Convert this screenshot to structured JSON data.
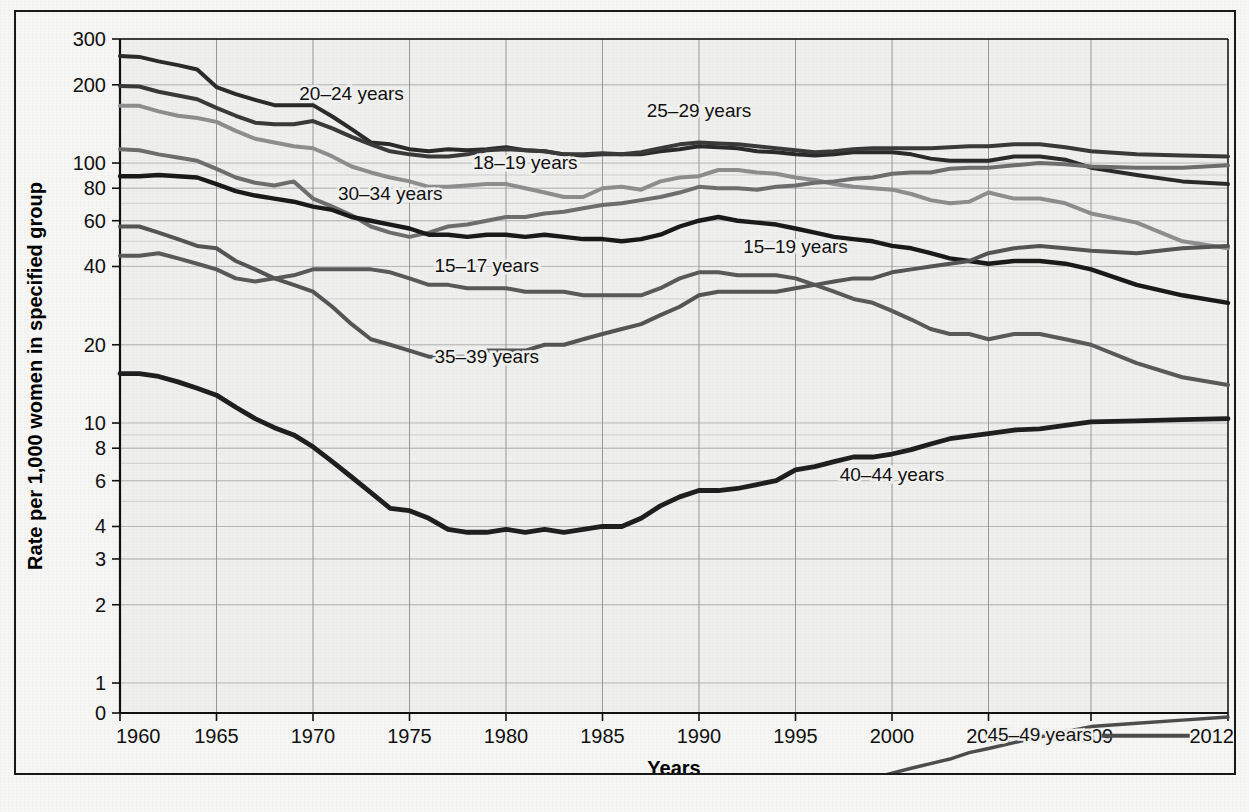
{
  "figure": {
    "background_color": "#f6f6f4",
    "border_color": "#1a1a1a",
    "plot_background_color": "#efefed"
  },
  "axes": {
    "y_label": "Rate per 1,000 women in specified group",
    "x_label": "Years",
    "y_ticks": [
      "300",
      "200",
      "100",
      "80",
      "60",
      "40",
      "20",
      "10",
      "8",
      "6",
      "4",
      "3",
      "2",
      "1",
      "0"
    ],
    "x_ticks": [
      "1960",
      "1965",
      "1970",
      "1975",
      "1980",
      "1985",
      "1990",
      "1995",
      "2000",
      "2005",
      "2009",
      "2012"
    ],
    "y_scale": "log",
    "grid": "on"
  },
  "labels": {
    "s20_24": "20–24 years",
    "s25_29": "25–29 years",
    "s18_19": "18–19 years",
    "s30_34": "30–34 years",
    "s15_19": "15–19 years",
    "s15_17": "15–17 years",
    "s35_39": "35–39 years",
    "s40_44": "40–44 years",
    "s45_49": "45–49 years"
  },
  "chart_data": {
    "type": "line",
    "title": "",
    "subtitle": "",
    "xlabel": "Years",
    "ylabel": "Rate per 1,000 women in specified group",
    "yscale": "log",
    "ylim": [
      1,
      300
    ],
    "yticks": [
      300,
      200,
      100,
      80,
      60,
      40,
      20,
      10,
      8,
      6,
      4,
      3,
      2,
      1,
      0
    ],
    "xticks": [
      1960,
      1965,
      1970,
      1975,
      1980,
      1985,
      1990,
      1995,
      2000,
      2005,
      2009,
      2012
    ],
    "xlim": [
      1960,
      2012
    ],
    "grid": true,
    "legend": "inline-annotations",
    "x": [
      1960,
      1961,
      1962,
      1963,
      1964,
      1965,
      1966,
      1967,
      1968,
      1969,
      1970,
      1971,
      1972,
      1973,
      1974,
      1975,
      1976,
      1977,
      1978,
      1979,
      1980,
      1981,
      1982,
      1983,
      1984,
      1985,
      1986,
      1987,
      1988,
      1989,
      1990,
      1991,
      1992,
      1993,
      1994,
      1995,
      1996,
      1997,
      1998,
      1999,
      2000,
      2001,
      2002,
      2003,
      2004,
      2005,
      2006,
      2007,
      2008,
      2009,
      2010,
      2011,
      2012
    ],
    "series": [
      {
        "name": "20–24 years",
        "color": "#2b2b2b",
        "width": 4.0,
        "values": [
          258,
          256,
          246,
          238,
          229,
          196,
          184,
          175,
          167,
          167,
          167,
          151,
          135,
          120,
          118,
          113,
          111,
          113,
          112,
          113,
          115,
          112,
          111,
          108,
          107,
          108,
          108,
          108,
          111,
          113,
          116,
          115,
          114,
          111,
          110,
          108,
          107,
          108,
          110,
          110,
          110,
          108,
          104,
          102,
          102,
          102,
          106,
          106,
          103,
          96,
          90,
          85,
          83
        ]
      },
      {
        "name": "25–29 years",
        "color": "#3a3a3a",
        "width": 4.0,
        "values": [
          198,
          197,
          188,
          182,
          176,
          163,
          152,
          143,
          141,
          141,
          145,
          136,
          126,
          118,
          111,
          108,
          106,
          106,
          108,
          112,
          113,
          112,
          111,
          108,
          108,
          109,
          108,
          110,
          114,
          118,
          120,
          119,
          118,
          116,
          114,
          112,
          110,
          111,
          113,
          114,
          114,
          114,
          114,
          115,
          116,
          116,
          118,
          118,
          115,
          111,
          108,
          107,
          106
        ]
      },
      {
        "name": "18–19 years",
        "color": "#8e8e8e",
        "width": 4.0,
        "values": [
          166,
          166,
          158,
          152,
          149,
          144,
          133,
          124,
          120,
          116,
          114,
          106,
          97,
          92,
          88,
          85,
          81,
          81,
          82,
          83,
          83,
          80,
          77,
          74,
          74,
          80,
          81,
          79,
          85,
          88,
          89,
          94,
          94,
          92,
          91,
          88,
          86,
          83,
          81,
          80,
          79,
          76,
          72,
          70,
          71,
          77,
          73,
          73,
          70,
          64,
          59,
          50,
          47
        ]
      },
      {
        "name": "30–34 years",
        "color": "#6e6e6e",
        "width": 4.0,
        "values": [
          113,
          112,
          108,
          105,
          102,
          95,
          88,
          84,
          82,
          85,
          73,
          68,
          63,
          57,
          54,
          52,
          54,
          57,
          58,
          60,
          62,
          62,
          64,
          65,
          67,
          69,
          70,
          72,
          74,
          77,
          81,
          80,
          80,
          79,
          81,
          82,
          84,
          85,
          87,
          88,
          91,
          92,
          92,
          95,
          96,
          96,
          98,
          100,
          99,
          97,
          96,
          96,
          98
        ]
      },
      {
        "name": "15–19 years",
        "color": "#1a1a1a",
        "width": 4.4,
        "values": [
          89,
          89,
          90,
          89,
          88,
          83,
          78,
          75,
          73,
          71,
          68,
          66,
          62,
          60,
          58,
          56,
          53,
          53,
          52,
          53,
          53,
          52,
          53,
          52,
          51,
          51,
          50,
          51,
          53,
          57,
          60,
          62,
          60,
          59,
          58,
          56,
          54,
          52,
          51,
          50,
          48,
          47,
          45,
          43,
          42,
          41,
          42,
          42,
          41,
          39,
          34,
          31,
          29
        ]
      },
      {
        "name": "15–17 years",
        "color": "#5a5a5a",
        "width": 4.0,
        "values": [
          44,
          44,
          45,
          43,
          41,
          39,
          36,
          35,
          36,
          37,
          39,
          39,
          39,
          39,
          38,
          36,
          34,
          34,
          33,
          33,
          33,
          32,
          32,
          32,
          31,
          31,
          31,
          31,
          33,
          36,
          38,
          38,
          37,
          37,
          37,
          36,
          34,
          32,
          30,
          29,
          27,
          25,
          23,
          22,
          22,
          21,
          22,
          22,
          21,
          20,
          17,
          15,
          14
        ]
      },
      {
        "name": "35–39 years",
        "color": "#555555",
        "width": 4.0,
        "values": [
          57,
          57,
          54,
          51,
          48,
          47,
          42,
          39,
          36,
          34,
          32,
          28,
          24,
          21,
          20,
          19,
          18,
          18,
          18,
          19,
          19,
          19,
          20,
          20,
          21,
          22,
          23,
          24,
          26,
          28,
          31,
          32,
          32,
          32,
          32,
          33,
          34,
          35,
          36,
          36,
          38,
          39,
          40,
          41,
          42,
          45,
          47,
          48,
          47,
          46,
          45,
          47,
          48
        ]
      },
      {
        "name": "40–44 years",
        "color": "#1f1f1f",
        "width": 4.8,
        "values": [
          15.5,
          15.5,
          15.1,
          14.4,
          13.6,
          12.8,
          11.5,
          10.4,
          9.6,
          9.0,
          8.1,
          7.1,
          6.2,
          5.4,
          4.7,
          4.6,
          4.3,
          3.9,
          3.8,
          3.8,
          3.9,
          3.8,
          3.9,
          3.8,
          3.9,
          4.0,
          4.0,
          4.3,
          4.8,
          5.2,
          5.5,
          5.5,
          5.6,
          5.8,
          6.0,
          6.6,
          6.8,
          7.1,
          7.4,
          7.4,
          7.6,
          7.9,
          8.3,
          8.7,
          8.9,
          9.1,
          9.4,
          9.5,
          9.8,
          10.1,
          10.2,
          10.3,
          10.4
        ]
      },
      {
        "name": "45–49 years",
        "color": "#4d4d4d",
        "width": 3.4,
        "values": [
          0.25,
          0.25,
          0.25,
          0.25,
          0.25,
          0.25,
          0.25,
          0.25,
          0.25,
          0.25,
          0.25,
          0.25,
          0.26,
          0.26,
          0.26,
          0.26,
          0.26,
          0.26,
          0.27,
          0.27,
          0.27,
          0.28,
          0.28,
          0.29,
          0.29,
          0.3,
          0.3,
          0.31,
          0.32,
          0.33,
          0.34,
          0.35,
          0.36,
          0.37,
          0.38,
          0.39,
          0.4,
          0.4,
          0.42,
          0.43,
          0.45,
          0.47,
          0.49,
          0.51,
          0.54,
          0.56,
          0.59,
          0.62,
          0.65,
          0.68,
          0.7,
          0.72,
          0.74
        ]
      }
    ],
    "annotations": [
      {
        "text": "20–24 years",
        "x": 1972,
        "y": 175
      },
      {
        "text": "25–29 years",
        "x": 1990,
        "y": 150
      },
      {
        "text": "18–19 years",
        "x": 1981,
        "y": 95
      },
      {
        "text": "30–34 years",
        "x": 1974,
        "y": 72
      },
      {
        "text": "15–19 years",
        "x": 1995,
        "y": 45
      },
      {
        "text": "15–17 years",
        "x": 1979,
        "y": 38
      },
      {
        "text": "35–39 years",
        "x": 1979,
        "y": 17
      },
      {
        "text": "40–44 years",
        "x": 2000,
        "y": 6
      },
      {
        "text": "45–49 years",
        "x": 2007,
        "y": 0.6
      }
    ]
  }
}
